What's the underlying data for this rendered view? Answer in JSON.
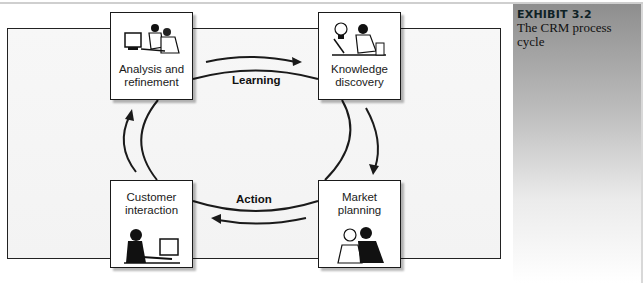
{
  "exhibit": {
    "number": "EXHIBIT 3.2",
    "caption": "The CRM process cycle"
  },
  "diagram": {
    "title": "The CRM process cycle",
    "nodes": [
      {
        "id": "analysis",
        "label_line1": "Analysis and",
        "label_line2": "refinement",
        "icon": "people-at-computer-icon"
      },
      {
        "id": "knowledge",
        "label_line1": "Knowledge",
        "label_line2": "discovery",
        "icon": "lightbulb-person-icon"
      },
      {
        "id": "market",
        "label_line1": "Market",
        "label_line2": "planning",
        "icon": "two-people-planning-icon"
      },
      {
        "id": "customer",
        "label_line1": "Customer",
        "label_line2": "interaction",
        "icon": "person-at-computer-icon"
      }
    ],
    "edges": [
      {
        "from": "analysis",
        "to": "knowledge",
        "label": "Learning"
      },
      {
        "from": "knowledge",
        "to": "market",
        "label": ""
      },
      {
        "from": "market",
        "to": "customer",
        "label": "Action"
      },
      {
        "from": "customer",
        "to": "analysis",
        "label": ""
      }
    ],
    "flow_labels": {
      "learning": "Learning",
      "action": "Action"
    }
  },
  "colors": {
    "line": "#1a1a1a",
    "panel_top": "#8e8e8e",
    "panel_bottom": "#ffffff",
    "exhibit_text": "#0f2226"
  }
}
